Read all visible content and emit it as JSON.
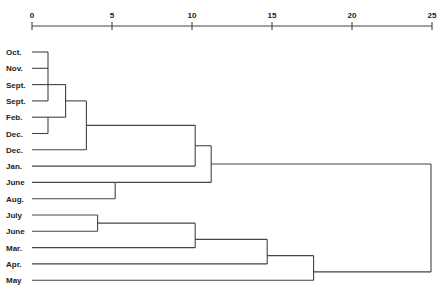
{
  "chart_data": {
    "type": "dendrogram",
    "title": "",
    "xlabel": "",
    "ylabel": "",
    "xlim": [
      0,
      25
    ],
    "x_ticks": [
      "0",
      "5",
      "10",
      "15",
      "20",
      "25"
    ],
    "leaves": [
      "Oct.",
      "Nov.",
      "Sept.",
      "Sept.",
      "Feb.",
      "Dec.",
      "Dec.",
      "Jan.",
      "June",
      "Aug.",
      "July",
      "June",
      "Mar.",
      "Apr.",
      "May"
    ],
    "merges": [
      {
        "members": [
          "Oct.",
          "Nov.",
          "Sept.",
          "Sept."
        ],
        "distance": 1.0
      },
      {
        "members": [
          "Feb.",
          "Dec."
        ],
        "distance": 1.0
      },
      {
        "members": [
          "Oct.-Sept. cluster",
          "Feb.-Dec. cluster"
        ],
        "distance": 2.1
      },
      {
        "members": [
          "previous",
          "Dec."
        ],
        "distance": 3.4
      },
      {
        "members": [
          "June",
          "Aug."
        ],
        "distance": 5.2
      },
      {
        "members": [
          "Oct.-Dec. cluster",
          "Jan."
        ],
        "distance": 10.2
      },
      {
        "members": [
          "Oct.-Jan. cluster",
          "June-Aug. cluster"
        ],
        "distance": 11.2
      },
      {
        "members": [
          "July",
          "June"
        ],
        "distance": 4.1
      },
      {
        "members": [
          "July-June cluster",
          "Mar."
        ],
        "distance": 10.2
      },
      {
        "members": [
          "previous",
          "Apr."
        ],
        "distance": 14.7
      },
      {
        "members": [
          "previous",
          "May"
        ],
        "distance": 17.6
      },
      {
        "members": [
          "upper cluster",
          "lower cluster"
        ],
        "distance": 25.0
      }
    ],
    "grid": false,
    "legend": null
  }
}
